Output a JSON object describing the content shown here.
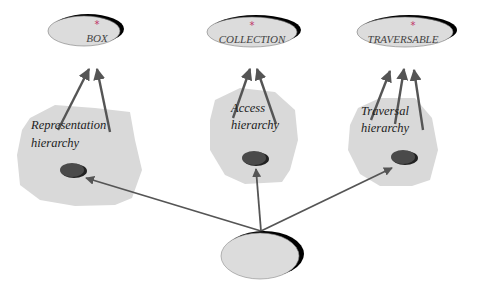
{
  "diagram": {
    "top_classes": [
      {
        "id": "box",
        "label": "BOX",
        "deferred_marker": "*"
      },
      {
        "id": "collection",
        "label": "COLLECTION",
        "deferred_marker": "*"
      },
      {
        "id": "traversable",
        "label": "TRAVERSABLE",
        "deferred_marker": "*"
      }
    ],
    "hierarchies": [
      {
        "id": "representation",
        "line1": "Representation",
        "line2": "hierarchy",
        "arrows_up": 2
      },
      {
        "id": "access",
        "line1": "Access",
        "line2": "hierarchy",
        "arrows_up": 2
      },
      {
        "id": "traversal",
        "line1": "Traversal",
        "line2": "hierarchy",
        "arrows_up": 3
      }
    ],
    "bottom_class": {
      "id": "bottom",
      "label": ""
    },
    "colors": {
      "ellipse_fill": "#dcdcdc",
      "ellipse_shadow": "#000000",
      "cloud_fill": "#d9d9d9",
      "arrow": "#555555",
      "inner_node": "#4a4a4a",
      "star": "#c0306a"
    }
  }
}
